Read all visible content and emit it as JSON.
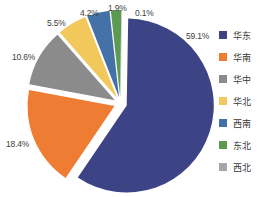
{
  "chart_data": {
    "type": "pie",
    "title": "",
    "categories": [
      "华东",
      "华南",
      "华中",
      "华北",
      "西南",
      "东北",
      "西北"
    ],
    "values": [
      59.1,
      18.4,
      10.6,
      5.5,
      4.2,
      1.9,
      0.1
    ],
    "value_labels": [
      "59.1%",
      "18.4%",
      "10.6%",
      "5.5%",
      "4.2%",
      "1.9%",
      "0.1%"
    ],
    "unit": "%",
    "colors": [
      "#3c4486",
      "#ee7d33",
      "#8b8b8b",
      "#f2c75c",
      "#4472a8",
      "#5c9a52",
      "#a6a6a6"
    ],
    "legend_position": "right",
    "exploded": true,
    "grid": false
  },
  "legend": {
    "items": [
      {
        "label": "华东",
        "color": "#3c4486"
      },
      {
        "label": "华南",
        "color": "#ee7d33"
      },
      {
        "label": "华中",
        "color": "#8b8b8b"
      },
      {
        "label": "华北",
        "color": "#f2c75c"
      },
      {
        "label": "西南",
        "color": "#4472a8"
      },
      {
        "label": "东北",
        "color": "#5c9a52"
      },
      {
        "label": "西北",
        "color": "#a6a6a6"
      }
    ]
  },
  "labels": {
    "huadong": "59.1%",
    "huanan": "18.4%",
    "huazhong": "10.6%",
    "huabei": "5.5%",
    "xinan": "4.2%",
    "dongbei": "1.9%",
    "xibei": "0.1%"
  }
}
